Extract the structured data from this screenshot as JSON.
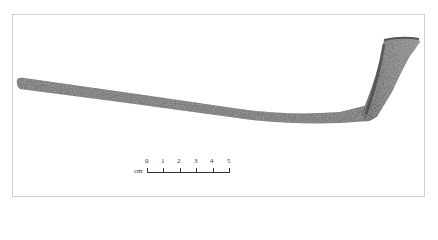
{
  "image": {
    "subject": "clay tobacco pipe (stem and bowl fragment)",
    "background": "#ffffff",
    "frame_color": "#cfcfcf",
    "artifact_color": "#6b6b6b"
  },
  "scale_bar": {
    "unit": "cm",
    "ticks": [
      "0",
      "1",
      "2",
      "3",
      "4",
      "5"
    ]
  }
}
